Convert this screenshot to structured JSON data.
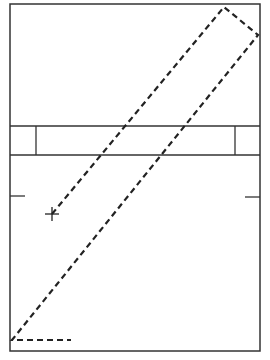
{
  "diagram": {
    "type": "court-like plan with dashed path",
    "colors": {
      "background": "#ffffff",
      "stroke": "#333333",
      "dashed": "#222222"
    },
    "outer_rect": {
      "x1": 10,
      "y1": 4,
      "x2": 260,
      "y2": 351
    },
    "band": {
      "y_top": 126,
      "y_bottom": 155,
      "left_divider_x": 36,
      "right_divider_x": 235
    },
    "ticks": [
      {
        "name": "left-tick",
        "x1": 10,
        "y1": 196,
        "x2": 25,
        "y2": 196
      },
      {
        "name": "right-tick",
        "x1": 245,
        "y1": 197,
        "x2": 260,
        "y2": 197
      }
    ],
    "dashed_path": [
      {
        "x": 52,
        "y": 214
      },
      {
        "x": 224,
        "y": 7
      },
      {
        "x": 258,
        "y": 35
      },
      {
        "x": 12,
        "y": 340
      },
      {
        "x": 71,
        "y": 340
      }
    ],
    "cross_marker": {
      "x": 52,
      "y": 214,
      "size": 7
    }
  }
}
